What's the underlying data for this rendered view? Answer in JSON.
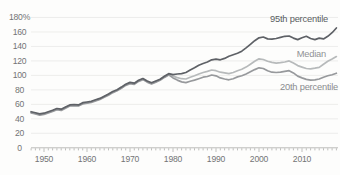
{
  "chart_data": {
    "type": "line",
    "title": "",
    "xlabel": "",
    "ylabel": "",
    "ylim": [
      0,
      180
    ],
    "xlim": [
      1947,
      2018.5
    ],
    "grid": "horizontal-light",
    "legend_position": "end-of-line-right-labels",
    "y_ticks": [
      180,
      160,
      140,
      120,
      100,
      80,
      60,
      40,
      20,
      0
    ],
    "y_tick_labels": [
      "180%",
      "160",
      "140",
      "120",
      "100",
      "80",
      "60",
      "40",
      "20",
      "0"
    ],
    "x_ticks_labeled": [
      1950,
      1960,
      1970,
      1980,
      1990,
      2000,
      2010
    ],
    "x_minor_tick_every": 1,
    "x": [
      1947,
      1948,
      1949,
      1950,
      1951,
      1952,
      1953,
      1954,
      1955,
      1956,
      1957,
      1958,
      1959,
      1960,
      1961,
      1962,
      1963,
      1964,
      1965,
      1966,
      1967,
      1968,
      1969,
      1970,
      1971,
      1972,
      1973,
      1974,
      1975,
      1976,
      1977,
      1978,
      1979,
      1980,
      1981,
      1982,
      1983,
      1984,
      1985,
      1986,
      1987,
      1988,
      1989,
      1990,
      1991,
      1992,
      1993,
      1994,
      1995,
      1996,
      1997,
      1998,
      1999,
      2000,
      2001,
      2002,
      2003,
      2004,
      2005,
      2006,
      2007,
      2008,
      2009,
      2010,
      2011,
      2012,
      2013,
      2014,
      2015,
      2016,
      2017,
      2018
    ],
    "series": [
      {
        "name": "Median",
        "color": "#b7babb",
        "label_color": "#909295",
        "label_anchor": {
          "x": 326,
          "y": 57
        },
        "values": [
          49,
          47.5,
          46,
          47,
          49,
          51,
          53.5,
          52.5,
          55.5,
          58.5,
          59,
          58.5,
          61.5,
          62.5,
          63.5,
          65.5,
          67.5,
          70.5,
          73.5,
          77,
          79.5,
          83,
          87,
          89.5,
          88.5,
          92.5,
          95,
          91.5,
          89,
          91.5,
          94,
          98,
          101.5,
          99,
          97,
          95.5,
          95,
          97.5,
          99.5,
          102,
          104,
          105.5,
          107.5,
          106.5,
          104.5,
          103.5,
          102.5,
          104,
          106.5,
          108.5,
          111.5,
          115.5,
          119.5,
          123,
          122,
          119.5,
          118,
          117,
          117.5,
          118.5,
          120,
          117,
          113.5,
          111.5,
          109.5,
          109,
          110,
          111,
          115.5,
          119.5,
          122.5,
          126
        ]
      },
      {
        "name": "20th percentile",
        "color": "#97999c",
        "label_color": "#8a8c8f",
        "label_anchor": {
          "x": 338,
          "y": 90
        },
        "values": [
          48.2,
          46.7,
          45.2,
          46.2,
          48.2,
          50.2,
          52.7,
          51.7,
          54.7,
          57.7,
          58.2,
          57.7,
          60.7,
          61.7,
          62.7,
          64.7,
          66.7,
          69.7,
          72.7,
          76.2,
          78.7,
          82.2,
          86.2,
          88.7,
          87.7,
          91.7,
          94.2,
          90.7,
          88.2,
          90.7,
          93.2,
          97.2,
          100.7,
          96.5,
          93.5,
          91,
          90,
          92,
          93.5,
          95.5,
          97.5,
          98.5,
          100.5,
          99.5,
          96.5,
          95,
          94,
          95.5,
          98,
          99.5,
          102,
          105,
          108,
          110.5,
          109.5,
          106.5,
          104.5,
          104,
          104.5,
          105.5,
          106.5,
          103.5,
          99,
          96.5,
          94.5,
          93.5,
          94,
          95,
          97.5,
          99.5,
          101,
          103
        ]
      },
      {
        "name": "95th percentile",
        "color": "#5e6166",
        "label_color": "#5a5d62",
        "label_anchor": {
          "x": 328,
          "y": 22
        },
        "values": [
          49.8,
          48.3,
          46.8,
          47.8,
          49.8,
          51.8,
          54.3,
          53.3,
          56.3,
          59.3,
          59.8,
          59.3,
          62.3,
          63.3,
          64.3,
          66.3,
          68.3,
          71.3,
          74.3,
          77.8,
          80.3,
          83.8,
          87.8,
          90.3,
          89.3,
          93.3,
          95.8,
          92.3,
          89.8,
          92.3,
          94.8,
          98.8,
          102.3,
          101,
          102,
          102.5,
          104,
          107.5,
          110.5,
          114,
          116.5,
          118.5,
          121.5,
          122.5,
          121.5,
          123.5,
          126.5,
          128.5,
          130.5,
          133.5,
          138,
          143,
          148,
          152,
          153,
          150.5,
          150,
          151,
          152.5,
          154,
          154.5,
          151.5,
          149.5,
          152,
          154,
          151,
          149.5,
          151.5,
          150.5,
          154,
          159,
          165.5
        ]
      }
    ]
  },
  "style": {
    "background": "#fdfdfc",
    "gridline_color": "#e9e9e7",
    "axis_line_color": "#b6b6b2",
    "tick_color": "#a3a3a0",
    "tick_label_color": "#737476",
    "line_width": 1.7
  },
  "layout_calibration": {
    "plot_left": 31,
    "plot_right": 338,
    "x_year_1950": 44,
    "px_per_year": 4.3,
    "y_value_0": 147.8,
    "px_per_unit": 0.7239
  }
}
